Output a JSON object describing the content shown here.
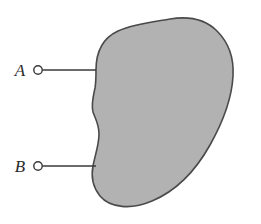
{
  "figure": {
    "background_color": "#ffffff",
    "blob": {
      "fill_color": "#b2b2b2",
      "stroke_color": "#4a4a4a",
      "stroke_width": 1.6,
      "name": "shaded-network-region"
    },
    "terminals": [
      {
        "label": "A",
        "circle_color": "#ffffff",
        "stroke_color": "#3a3a3a",
        "lead_color": "#3a3a3a",
        "cx": 38,
        "cy": 70,
        "r": 4.2,
        "lead_x2": 96,
        "label_x": 20,
        "label_y": 76
      },
      {
        "label": "B",
        "circle_color": "#ffffff",
        "stroke_color": "#3a3a3a",
        "lead_color": "#3a3a3a",
        "cx": 38,
        "cy": 166,
        "r": 4.2,
        "lead_x2": 96,
        "label_x": 20,
        "label_y": 172
      }
    ]
  }
}
